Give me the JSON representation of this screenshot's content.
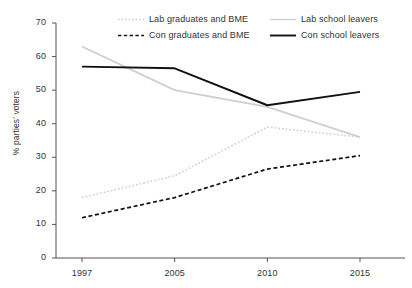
{
  "chart_data": {
    "type": "line",
    "title": "",
    "xlabel": "",
    "ylabel": "% parties' voters",
    "categories": [
      "1997",
      "2005",
      "2010",
      "2015"
    ],
    "x": [
      1997,
      2005,
      2010,
      2015
    ],
    "ylim": [
      0,
      70
    ],
    "yticks": [
      0,
      10,
      20,
      30,
      40,
      50,
      60,
      70
    ],
    "ytick_labels": [
      "0",
      "10",
      "20",
      "30",
      "40",
      "50",
      "60",
      "70"
    ],
    "grid": false,
    "legend_position": "top",
    "series": [
      {
        "name": "Lab graduates and BME",
        "values": [
          18,
          24.5,
          39,
          36
        ],
        "color": "#cfcfcf",
        "style": "dotted"
      },
      {
        "name": "Con graduates and BME",
        "values": [
          12,
          18,
          26.5,
          30.5
        ],
        "color": "#111111",
        "style": "dashed"
      },
      {
        "name": "Lab school leavers",
        "values": [
          63,
          50,
          45,
          36
        ],
        "color": "#cfcfcf",
        "style": "solid"
      },
      {
        "name": "Con school leavers",
        "values": [
          57,
          56.5,
          45.5,
          49.5
        ],
        "color": "#111111",
        "style": "solid"
      }
    ]
  },
  "axes": {
    "axis_color": "#555555"
  }
}
